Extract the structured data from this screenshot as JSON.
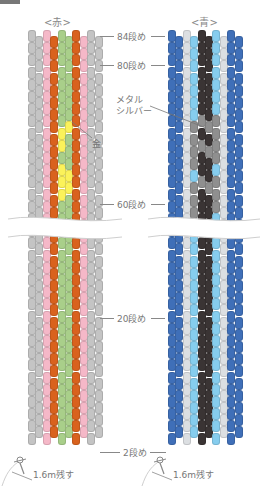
{
  "header": {
    "partial_text": ""
  },
  "patterns": [
    {
      "title": "<赤>",
      "columns": [
        "gray",
        "gray",
        "pink",
        "orange",
        "green",
        "green",
        "orange",
        "pink",
        "gray",
        "gray"
      ],
      "accent_color": "#ffff55",
      "accent_label": "金",
      "tail_label": "1.6m残す"
    },
    {
      "title": "<青>",
      "columns": [
        "blue",
        "blue",
        "silver",
        "lightblue",
        "black",
        "black",
        "lightblue",
        "silver",
        "blue",
        "blue"
      ],
      "accent_color": "#8c8c8c",
      "accent_label": "メタル\nシルバー",
      "tail_label": "1.6m残す"
    }
  ],
  "row_labels": {
    "r84": "84段め",
    "r80": "80段め",
    "r60": "60段め",
    "r20": "20段め",
    "r2": "2段め"
  },
  "callouts": {
    "gold": "金",
    "metal_silver_1": "メタル",
    "metal_silver_2": "シルバー"
  },
  "colors": {
    "gray": "#c4c4c4",
    "pink": "#f5b8c8",
    "orange": "#d9621e",
    "green": "#a9cf8a",
    "yellow": "#fbf25a",
    "blue": "#3f6fb8",
    "silver": "#dcdfe2",
    "lightblue": "#86cdee",
    "black": "#3a3434",
    "metal": "#8f8f8f"
  }
}
